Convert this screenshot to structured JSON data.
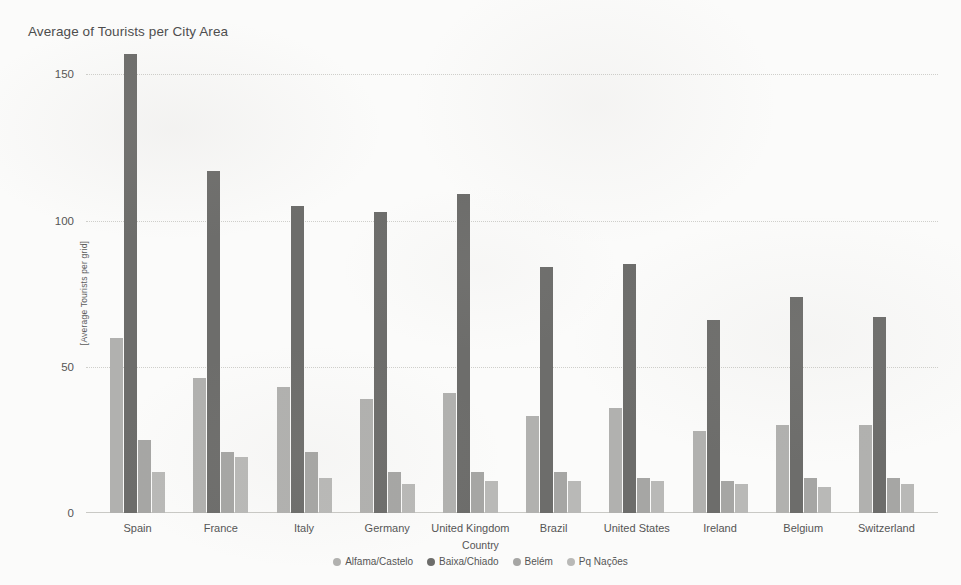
{
  "chart_data": {
    "type": "bar",
    "title": "Average of Tourists per City Area",
    "xlabel": "Country",
    "ylabel": "[Average Tourists per grid]",
    "ylim": [
      0,
      160
    ],
    "yticks": [
      0,
      50,
      100,
      150
    ],
    "grid": true,
    "legend_position": "bottom",
    "categories": [
      "Spain",
      "France",
      "Italy",
      "Germany",
      "United Kingdom",
      "Brazil",
      "United States",
      "Ireland",
      "Belgium",
      "Switzerland"
    ],
    "series": [
      {
        "name": "Alfama/Castelo",
        "color": "#b1b1af",
        "values": [
          60,
          46,
          43,
          39,
          41,
          33,
          36,
          28,
          30,
          30
        ]
      },
      {
        "name": "Baixa/Chiado",
        "color": "#6d6d6b",
        "values": [
          157,
          117,
          105,
          103,
          109,
          84,
          85,
          66,
          74,
          67
        ]
      },
      {
        "name": "Belém",
        "color": "#a6a6a4",
        "values": [
          25,
          21,
          21,
          14,
          14,
          14,
          12,
          11,
          12,
          12
        ]
      },
      {
        "name": "Pq Nações",
        "color": "#b9b9b7",
        "values": [
          14,
          19,
          12,
          10,
          11,
          11,
          11,
          10,
          9,
          10
        ]
      }
    ]
  }
}
